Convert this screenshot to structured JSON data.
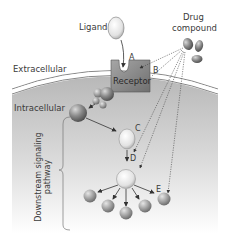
{
  "diagram": {
    "labels": {
      "ligand": "Ligand",
      "drug_compound_line1": "Drug",
      "drug_compound_line2": "compound",
      "receptor": "Receptor",
      "extracellular": "Extracellular",
      "intracellular": "Intracellular",
      "pathway_line1": "Downstream signaling",
      "pathway_line2": "pathway"
    },
    "points": {
      "A": "A",
      "B": "B",
      "C": "C",
      "D": "D",
      "E": "E"
    },
    "colors": {
      "cell_interior_top": "#bdbdbd",
      "cell_interior_bottom": "#ffffff",
      "membrane": "#8a8a8a",
      "receptor": "#8c8c8c",
      "sphere_dark": "#6e6e6e",
      "sphere_light": "#e8e8e8",
      "arrow": "#333333"
    }
  }
}
